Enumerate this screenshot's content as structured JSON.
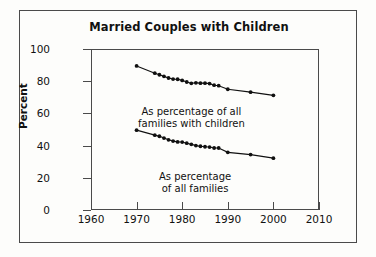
{
  "chart_data": {
    "type": "line",
    "title": "Married Couples with Children",
    "xlabel": "",
    "ylabel": "Percent",
    "xlim": [
      1960,
      2010
    ],
    "ylim": [
      0,
      100
    ],
    "xticks": [
      1960,
      1970,
      1980,
      1990,
      2000,
      2010
    ],
    "yticks": [
      0,
      20,
      40,
      60,
      80,
      100
    ],
    "grid": false,
    "legend": "inline-annotations",
    "annotations": [
      {
        "id": "upper",
        "line1": "As percentage of all",
        "line2": "families with children"
      },
      {
        "id": "lower",
        "line1": "As percentage",
        "line2": "of all families"
      }
    ],
    "series": [
      {
        "name": "As percentage of all families with children",
        "x": [
          1970,
          1974,
          1975,
          1976,
          1977,
          1978,
          1979,
          1980,
          1981,
          1982,
          1983,
          1984,
          1985,
          1986,
          1987,
          1988,
          1990,
          1995,
          2000
        ],
        "values": [
          89.5,
          85.0,
          84.0,
          83.0,
          82.0,
          81.3,
          81.2,
          80.5,
          79.5,
          78.7,
          79.0,
          78.8,
          78.8,
          78.5,
          77.5,
          77.2,
          75.0,
          73.2,
          71.2
        ]
      },
      {
        "name": "As percentage of all families",
        "x": [
          1970,
          1974,
          1975,
          1976,
          1977,
          1978,
          1979,
          1980,
          1981,
          1982,
          1983,
          1984,
          1985,
          1986,
          1987,
          1988,
          1990,
          1995,
          2000
        ],
        "values": [
          49.6,
          46.5,
          45.8,
          44.7,
          43.6,
          42.8,
          42.3,
          42.2,
          41.5,
          40.8,
          40.0,
          39.6,
          39.3,
          39.1,
          38.5,
          38.5,
          35.8,
          34.4,
          32.2
        ]
      }
    ]
  }
}
